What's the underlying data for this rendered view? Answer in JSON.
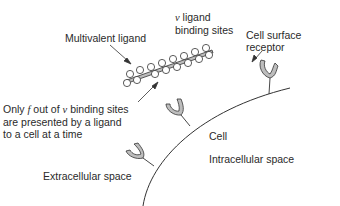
{
  "labels": {
    "multivalent_ligand": "Multivalent ligand",
    "binding_sites_symbol": "ν",
    "binding_sites_line1": " ligand",
    "binding_sites_line2": "binding sites",
    "cell_surface_receptor_line1": "Cell surface",
    "cell_surface_receptor_line2": "receptor",
    "only_f_line1_pre": "Only ",
    "only_f_symbol_f": "f",
    "only_f_line1_mid": " out of ",
    "only_f_symbol_nu": "ν",
    "only_f_line1_post": " binding sites",
    "only_f_line2": "are presented by a ligand",
    "only_f_line3": "to a cell at a time",
    "cell": "Cell",
    "intracellular_space": "Intracellular space",
    "extracellular_space": "Extracellular space"
  },
  "colors": {
    "line": "#333333",
    "ligand_fill": "#bdbdbd",
    "site_fill": "#ffffff",
    "text": "#2a2a2a"
  },
  "ligand": {
    "site_count": 16
  },
  "receptors": [
    {
      "name": "receptor-top-right",
      "x": 268,
      "y": 55
    },
    {
      "name": "receptor-middle",
      "x": 186,
      "y": 107
    },
    {
      "name": "receptor-lower",
      "x": 152,
      "y": 149
    }
  ]
}
